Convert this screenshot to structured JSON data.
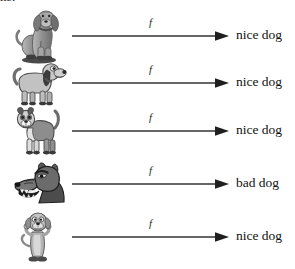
{
  "page": {
    "clipped_caption": "ns.",
    "background_color": "#ffffff",
    "ink_color": "#111111",
    "width": 295,
    "height": 269
  },
  "diagram": {
    "type": "function-mapping",
    "arrow_label": "f",
    "rows": [
      {
        "input_icon": "sitting-bloodhound-dog-image",
        "input_alt": "sitting bloodhound dog",
        "arrow_label": "f",
        "output_label": "nice dog"
      },
      {
        "input_icon": "cartoon-dachshund-dog-image",
        "input_alt": "cartoon long-bodied hound dog facing right",
        "arrow_label": "f",
        "output_label": "nice dog"
      },
      {
        "input_icon": "standing-terrier-dog-image",
        "input_alt": "standing terrier dog facing left",
        "arrow_label": "f",
        "output_label": "nice dog"
      },
      {
        "input_icon": "snarling-angry-dog-head-image",
        "input_alt": "snarling angry dog head with bared teeth",
        "arrow_label": "f",
        "output_label": "bad dog"
      },
      {
        "input_icon": "upright-cartoon-dog-image",
        "input_alt": "cartoon dog standing upright on hind legs",
        "arrow_label": "f",
        "output_label": "nice dog"
      }
    ]
  }
}
